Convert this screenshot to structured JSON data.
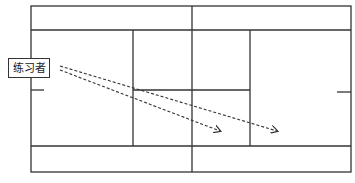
{
  "diagram": {
    "type": "tennis-court-top-view",
    "label": "练习者",
    "colors": {
      "line": "#333333",
      "background": "#ffffff",
      "dash": "#333333"
    },
    "arrows": [
      {
        "from": [
          60,
          66
        ],
        "to": [
          277,
          131
        ],
        "style": "dashed"
      },
      {
        "from": [
          60,
          70
        ],
        "to": [
          220,
          131
        ],
        "style": "dashed"
      }
    ]
  }
}
